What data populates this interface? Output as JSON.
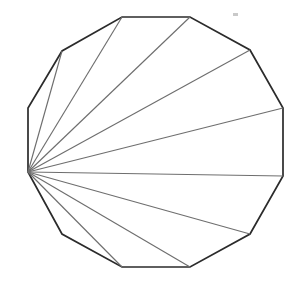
{
  "figure": {
    "name": "triangulated-dodecagon",
    "title": "",
    "background_color": "#ffffff",
    "canvas": {
      "width": 298,
      "height": 285
    }
  },
  "chart_data": {
    "type": "diagram",
    "shape": "regular-dodecagon",
    "title": "",
    "xlabel": "",
    "ylabel": "",
    "sides": 12,
    "diagonals_from_apex": 9,
    "triangles": 10,
    "grid": false,
    "legend": null,
    "outline": {
      "stroke_color": "#2b2b2b",
      "stroke_width": 1.7,
      "fill_color": "#ffffff"
    },
    "diagonals": {
      "stroke_color": "#6e6e6e",
      "stroke_width": 1.15,
      "origin_index": 0
    },
    "vertices": [
      {
        "index": 0,
        "label": "A",
        "x": 28,
        "y": 172
      },
      {
        "index": 1,
        "label": "B",
        "x": 28,
        "y": 108
      },
      {
        "index": 2,
        "label": "C",
        "x": 62,
        "y": 51
      },
      {
        "index": 3,
        "label": "D",
        "x": 122,
        "y": 17
      },
      {
        "index": 4,
        "label": "E",
        "x": 190,
        "y": 17
      },
      {
        "index": 5,
        "label": "F",
        "x": 250,
        "y": 50
      },
      {
        "index": 6,
        "label": "G",
        "x": 283,
        "y": 108
      },
      {
        "index": 7,
        "label": "H",
        "x": 283,
        "y": 176
      },
      {
        "index": 8,
        "label": "I",
        "x": 250,
        "y": 234
      },
      {
        "index": 9,
        "label": "J",
        "x": 190,
        "y": 267
      },
      {
        "index": 10,
        "label": "K",
        "x": 122,
        "y": 267
      },
      {
        "index": 11,
        "label": "L",
        "x": 62,
        "y": 234
      }
    ],
    "diagonal_segments": [
      {
        "from": 0,
        "to": 2,
        "x1": 28,
        "y1": 172,
        "x2": 62,
        "y2": 51
      },
      {
        "from": 0,
        "to": 3,
        "x1": 28,
        "y1": 172,
        "x2": 122,
        "y2": 17
      },
      {
        "from": 0,
        "to": 4,
        "x1": 28,
        "y1": 172,
        "x2": 190,
        "y2": 17
      },
      {
        "from": 0,
        "to": 5,
        "x1": 28,
        "y1": 172,
        "x2": 250,
        "y2": 50
      },
      {
        "from": 0,
        "to": 6,
        "x1": 28,
        "y1": 172,
        "x2": 283,
        "y2": 108
      },
      {
        "from": 0,
        "to": 7,
        "x1": 28,
        "y1": 172,
        "x2": 283,
        "y2": 176
      },
      {
        "from": 0,
        "to": 8,
        "x1": 28,
        "y1": 172,
        "x2": 250,
        "y2": 234
      },
      {
        "from": 0,
        "to": 9,
        "x1": 28,
        "y1": 172,
        "x2": 190,
        "y2": 267
      },
      {
        "from": 0,
        "to": 10,
        "x1": 28,
        "y1": 172,
        "x2": 122,
        "y2": 267
      }
    ],
    "artifacts": [
      {
        "name": "speck",
        "x": 233,
        "y": 13,
        "width": 5,
        "height": 3,
        "color": "#c9c9c9"
      }
    ]
  }
}
